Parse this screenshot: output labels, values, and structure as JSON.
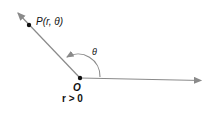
{
  "diagram": {
    "point_label": "P(r, θ)",
    "angle_label": "θ",
    "origin_label": "O",
    "condition_label": "r > 0",
    "colors": {
      "ray": "#8a8a8a",
      "point": "#111111",
      "text": "#111111"
    }
  }
}
